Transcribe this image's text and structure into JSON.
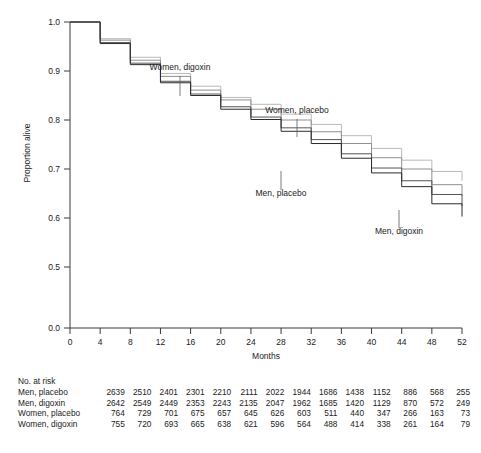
{
  "chart_data": {
    "type": "line",
    "title": "",
    "xlabel": "Months",
    "ylabel": "Proportion alive",
    "xlim": [
      0,
      52
    ],
    "ylim": [
      0.0,
      1.0
    ],
    "x_ticks": [
      0,
      4,
      8,
      12,
      16,
      20,
      24,
      28,
      32,
      36,
      40,
      44,
      48,
      52
    ],
    "x_tick_labels": [
      "0",
      "4",
      "8",
      "12",
      "16",
      "20",
      "24",
      "28",
      "32",
      "36",
      "40",
      "44",
      "48",
      "52"
    ],
    "y_ticks": [
      0.0,
      0.5,
      0.6,
      0.7,
      0.8,
      0.9,
      1.0
    ],
    "y_tick_labels": [
      "0.0",
      "0.5",
      "0.6",
      "0.7",
      "0.8",
      "0.9",
      "1.0"
    ],
    "y_axis_break_between": [
      0.0,
      0.5
    ],
    "grid": false,
    "legend": "inline-annotations",
    "step_x": [
      0,
      4,
      8,
      12,
      16,
      20,
      24,
      28,
      32,
      36,
      40,
      44,
      48,
      52
    ],
    "series": [
      {
        "name": "Women, placebo",
        "color": "#b9b9b9",
        "values": [
          1.0,
          0.966,
          0.928,
          0.895,
          0.869,
          0.846,
          0.832,
          0.812,
          0.791,
          0.768,
          0.742,
          0.718,
          0.695,
          0.676
        ]
      },
      {
        "name": "Women, digoxin",
        "color": "#8f8f8f",
        "values": [
          1.0,
          0.963,
          0.922,
          0.889,
          0.861,
          0.841,
          0.822,
          0.8,
          0.776,
          0.752,
          0.723,
          0.7,
          0.668,
          0.645
        ]
      },
      {
        "name": "Men, placebo",
        "color": "#555555",
        "values": [
          1.0,
          0.958,
          0.916,
          0.879,
          0.853,
          0.827,
          0.806,
          0.784,
          0.76,
          0.731,
          0.702,
          0.676,
          0.648,
          0.625
        ]
      },
      {
        "name": "Men, digoxin",
        "color": "#2b2b2b",
        "values": [
          1.0,
          0.956,
          0.913,
          0.876,
          0.85,
          0.822,
          0.801,
          0.777,
          0.752,
          0.722,
          0.692,
          0.664,
          0.629,
          0.603
        ]
      }
    ],
    "annotations": [
      {
        "text": "Women, digoxin",
        "label_x": 180,
        "label_y": 70,
        "leader_from_y": 76,
        "leader_to_y": 96
      },
      {
        "text": "Women, placebo",
        "label_x": 297,
        "label_y": 113,
        "leader_from_y": 119,
        "leader_to_y": 137
      },
      {
        "text": "Men, placebo",
        "label_x": 281,
        "label_y": 196,
        "leader_from_y": 171,
        "leader_to_y": 190
      },
      {
        "text": "Men, digoxin",
        "label_x": 399,
        "label_y": 234,
        "leader_from_y": 210,
        "leader_to_y": 228
      }
    ]
  },
  "risk_table": {
    "title": "No. at risk",
    "columns": [
      "0",
      "4",
      "8",
      "12",
      "16",
      "20",
      "24",
      "28",
      "32",
      "36",
      "40",
      "44",
      "48",
      "52"
    ],
    "rows": [
      {
        "label": "Men, placebo",
        "values": [
          "2639",
          "2510",
          "2401",
          "2301",
          "2210",
          "2111",
          "2022",
          "1944",
          "1686",
          "1438",
          "1152",
          "886",
          "568",
          "255"
        ]
      },
      {
        "label": "Men, digoxin",
        "values": [
          "2642",
          "2549",
          "2449",
          "2353",
          "2243",
          "2135",
          "2047",
          "1962",
          "1685",
          "1420",
          "1129",
          "870",
          "572",
          "249"
        ]
      },
      {
        "label": "Women, placebo",
        "values": [
          "764",
          "729",
          "701",
          "675",
          "657",
          "645",
          "626",
          "603",
          "511",
          "440",
          "347",
          "266",
          "163",
          "73"
        ]
      },
      {
        "label": "Women, digoxin",
        "values": [
          "755",
          "720",
          "693",
          "665",
          "638",
          "621",
          "596",
          "564",
          "488",
          "414",
          "338",
          "261",
          "164",
          "79"
        ]
      }
    ]
  }
}
